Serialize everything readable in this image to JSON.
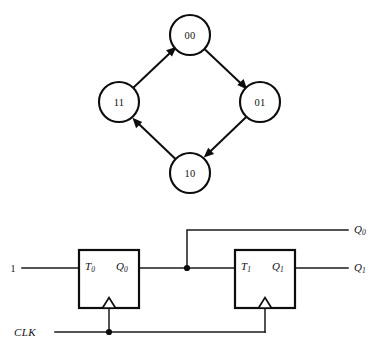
{
  "figure": {
    "kind": "state-diagram-and-t-flipflop-circuit",
    "background_color": "#ffffff",
    "ink_color": "#0d0d0d"
  },
  "state_diagram": {
    "states": [
      {
        "id": "s00",
        "label": "00",
        "cx": 190,
        "cy": 35,
        "r": 20
      },
      {
        "id": "s01",
        "label": "01",
        "cx": 260,
        "cy": 102,
        "r": 20
      },
      {
        "id": "s10",
        "label": "10",
        "cx": 190,
        "cy": 173,
        "r": 20
      },
      {
        "id": "s11",
        "label": "11",
        "cx": 119,
        "cy": 102,
        "r": 20
      }
    ],
    "transitions": [
      {
        "id": "t-00-01",
        "from": "00",
        "to": "01"
      },
      {
        "id": "t-01-10",
        "from": "01",
        "to": "10"
      },
      {
        "id": "t-10-11",
        "from": "10",
        "to": "11"
      },
      {
        "id": "t-11-00",
        "from": "11",
        "to": "00"
      }
    ]
  },
  "circuit": {
    "inputs": {
      "constant_one": "1",
      "clock": "CLK"
    },
    "outputs": [
      {
        "id": "out-q0",
        "label": "Q",
        "subscript": "0"
      },
      {
        "id": "out-q1",
        "label": "Q",
        "subscript": "1"
      }
    ],
    "flipflops": [
      {
        "id": "ff0",
        "input_pin": "T",
        "input_sub": "0",
        "output_pin": "Q",
        "output_sub": "0",
        "x": 79,
        "y": 250,
        "w": 60,
        "h": 58
      },
      {
        "id": "ff1",
        "input_pin": "T",
        "input_sub": "1",
        "output_pin": "Q",
        "output_sub": "1",
        "x": 235,
        "y": 250,
        "w": 60,
        "h": 58
      }
    ]
  }
}
